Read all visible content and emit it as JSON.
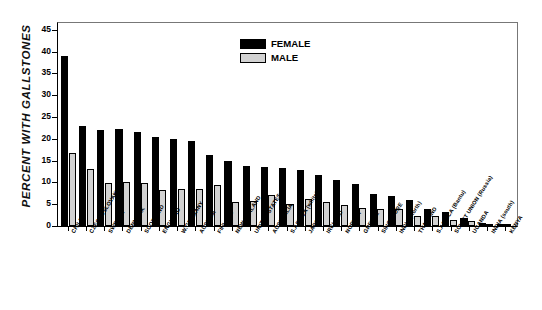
{
  "chart_data": {
    "type": "bar",
    "title": "",
    "xlabel": "",
    "ylabel": "PERCENT WITH GALLSTONES",
    "ylim": [
      0,
      47
    ],
    "yticks": [
      0,
      5,
      10,
      15,
      20,
      25,
      30,
      35,
      40,
      45
    ],
    "grid": false,
    "legend_position": "top-center",
    "categories": [
      "CHILE",
      "CZECHOSLOVAKIA",
      "SWEDEN",
      "DENMARK",
      "SCOTLAND",
      "ENGLAND",
      "W.GERMANY",
      "AUSTRIA",
      "FINLAND",
      "NEW ZEALAND",
      "UNITED STATES",
      "AUSTRALIA",
      "S.AFRICA (white)",
      "JAPAN",
      "IRELAND",
      "NORWAY",
      "GREECE",
      "SINGAPORE",
      "INDIA (north)",
      "THAILAND",
      "S.AFRICA (Bantu)",
      "SOVIET UNION (Russia)",
      "UGANDA",
      "INDIA (south)",
      "KENYA"
    ],
    "series": [
      {
        "name": "FEMALE",
        "color": "#000000",
        "values": [
          39.0,
          23.0,
          22.0,
          22.2,
          21.6,
          20.3,
          20.0,
          19.5,
          16.2,
          15.0,
          13.8,
          13.5,
          13.4,
          12.8,
          11.8,
          10.5,
          9.6,
          7.4,
          6.8,
          6.0,
          4.0,
          3.3,
          1.8,
          0.8,
          0.5
        ]
      },
      {
        "name": "MALE",
        "color": "#d2d2d2",
        "values": [
          16.8,
          13.1,
          9.9,
          10.0,
          9.9,
          8.2,
          8.5,
          8.5,
          9.3,
          5.6,
          5.7,
          7.0,
          5.0,
          6.1,
          5.5,
          4.9,
          4.2,
          3.8,
          4.0,
          2.2,
          2.3,
          1.4,
          1.1,
          0.4,
          0.3
        ]
      }
    ]
  },
  "legend": {
    "items": [
      {
        "label": "FEMALE",
        "color": "#000000"
      },
      {
        "label": "MALE",
        "color": "#d2d2d2"
      }
    ]
  }
}
